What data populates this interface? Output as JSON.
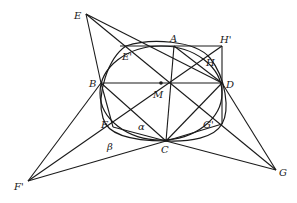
{
  "diagram": {
    "title": "",
    "colors": {
      "stroke": "#1a1a1a",
      "background": "#ffffff"
    },
    "points": {
      "E": {
        "label": "E",
        "x": 86,
        "y": 14
      },
      "A": {
        "label": "A",
        "x": 174,
        "y": 46
      },
      "Hp": {
        "label": "H'",
        "x": 222,
        "y": 46
      },
      "Ep": {
        "label": "E'",
        "x": 126,
        "y": 46
      },
      "H": {
        "label": "H",
        "x": 208,
        "y": 60
      },
      "B": {
        "label": "B",
        "x": 101,
        "y": 83
      },
      "M": {
        "label": "M",
        "x": 161,
        "y": 83
      },
      "D": {
        "label": "D",
        "x": 222,
        "y": 83
      },
      "F": {
        "label": "F",
        "x": 113,
        "y": 127
      },
      "Gp": {
        "label": "G'",
        "x": 222,
        "y": 124
      },
      "C": {
        "label": "C",
        "x": 166,
        "y": 141
      },
      "Fp": {
        "label": "F'",
        "x": 28,
        "y": 181
      },
      "G": {
        "label": "G",
        "x": 276,
        "y": 170
      }
    },
    "angles": {
      "alpha": {
        "label": "α"
      },
      "beta": {
        "label": "β"
      }
    }
  }
}
